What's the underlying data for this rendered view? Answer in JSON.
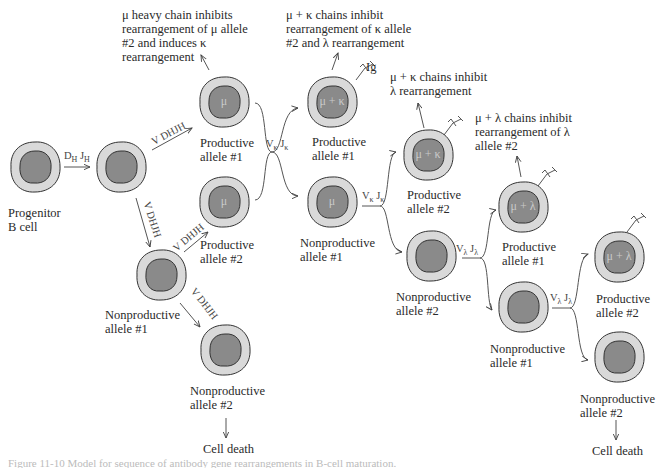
{
  "colors": {
    "outer": "#d9d9d9",
    "nucleus": "#8a8a8a",
    "stroke": "#333333",
    "inner_text": "#cfcfcf"
  },
  "cells": [
    {
      "id": "progenitor",
      "label_lines": [
        "Progenitor",
        "B cell"
      ],
      "inner": ""
    },
    {
      "id": "after-dj",
      "label_lines": [],
      "inner": ""
    },
    {
      "id": "h-prod-1",
      "label_lines": [
        "Productive",
        "allele #1"
      ],
      "inner": "μ"
    },
    {
      "id": "h-prod-2",
      "label_lines": [
        "Productive",
        "allele #2"
      ],
      "inner": "μ"
    },
    {
      "id": "h-nonprod-1",
      "label_lines": [
        "Nonproductive",
        "allele #1"
      ],
      "inner": ""
    },
    {
      "id": "h-nonprod-2",
      "label_lines": [
        "Nonproductive",
        "allele #2"
      ],
      "inner": ""
    },
    {
      "id": "k-prod-1",
      "label_lines": [
        "Productive",
        "allele #1"
      ],
      "inner": "μ + κ"
    },
    {
      "id": "k-nonprod-1",
      "label_lines": [
        "Nonproductive",
        "allele #1"
      ],
      "inner": "μ"
    },
    {
      "id": "k-prod-2",
      "label_lines": [
        "Productive",
        "allele #2"
      ],
      "inner": "μ + κ"
    },
    {
      "id": "k-nonprod-2",
      "label_lines": [
        "Nonproductive",
        "allele #2"
      ],
      "inner": ""
    },
    {
      "id": "l-prod-1",
      "label_lines": [
        "Productive",
        "allele #1"
      ],
      "inner": "μ + λ"
    },
    {
      "id": "l-nonprod-1",
      "label_lines": [
        "Nonproductive",
        "allele #1"
      ],
      "inner": ""
    },
    {
      "id": "l-prod-2",
      "label_lines": [
        "Productive",
        "allele #2"
      ],
      "inner": "μ + λ"
    },
    {
      "id": "l-nonprod-2",
      "label_lines": [
        "Nonproductive",
        "allele #2"
      ],
      "inner": ""
    }
  ],
  "notes": {
    "mu": [
      "μ heavy chain inhibits",
      "rearrangement of μ allele",
      "#2 and induces κ",
      "rearrangement"
    ],
    "mu_kappa_1": [
      "μ + κ chains inhibit",
      "rearrangement of κ allele",
      "#2 and λ rearrangement"
    ],
    "mu_kappa_2": [
      "μ + κ chains inhibit",
      "λ rearrangement"
    ],
    "mu_lambda": [
      "μ + λ chains inhibit",
      "rearrangement of λ",
      "allele #2"
    ]
  },
  "ig_label": "Ig",
  "cell_death": "Cell death",
  "genes": {
    "dj": {
      "d": "D",
      "d_sub": "H",
      "j": "J",
      "j_sub": "H"
    },
    "vdj": "V DHJH",
    "vk": {
      "v": "V",
      "v_sub": "κ",
      "j": "J",
      "j_sub": "κ"
    },
    "vl": {
      "v": "V",
      "v_sub": "λ",
      "j": "J",
      "j_sub": "λ"
    }
  },
  "caption": "Figure 11-10  Model for sequence of antibody gene rearrangements in B-cell maturation."
}
